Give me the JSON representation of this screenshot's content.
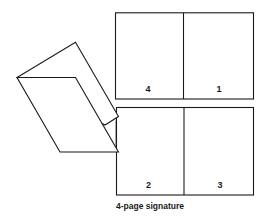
{
  "diagram": {
    "caption": "4-page signature",
    "sheets": {
      "top": {
        "left_page": "4",
        "right_page": "1"
      },
      "bottom": {
        "left_page": "2",
        "right_page": "3"
      }
    },
    "folded_sheet": {
      "description": "folded sheet being opened"
    },
    "colors": {
      "line": "#1a1a1a",
      "background": "#ffffff"
    }
  }
}
